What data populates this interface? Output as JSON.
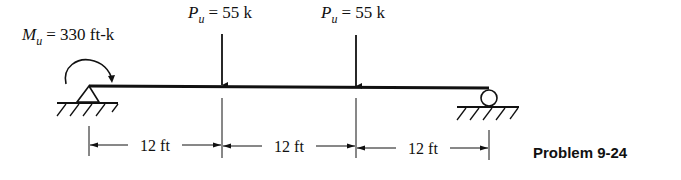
{
  "moment": {
    "symbol": "M",
    "subscript": "u",
    "value_text": "= 330 ft-k"
  },
  "loads": [
    {
      "symbol": "P",
      "subscript": "u",
      "value_text": "= 55 k"
    },
    {
      "symbol": "P",
      "subscript": "u",
      "value_text": "= 55 k"
    }
  ],
  "dimensions": [
    {
      "label": "12 ft"
    },
    {
      "label": "12 ft"
    },
    {
      "label": "12 ft"
    }
  ],
  "supports": {
    "left": "pin",
    "right": "roller"
  },
  "caption": "Problem 9-24",
  "colors": {
    "ink": "#111111",
    "background": "#ffffff"
  }
}
